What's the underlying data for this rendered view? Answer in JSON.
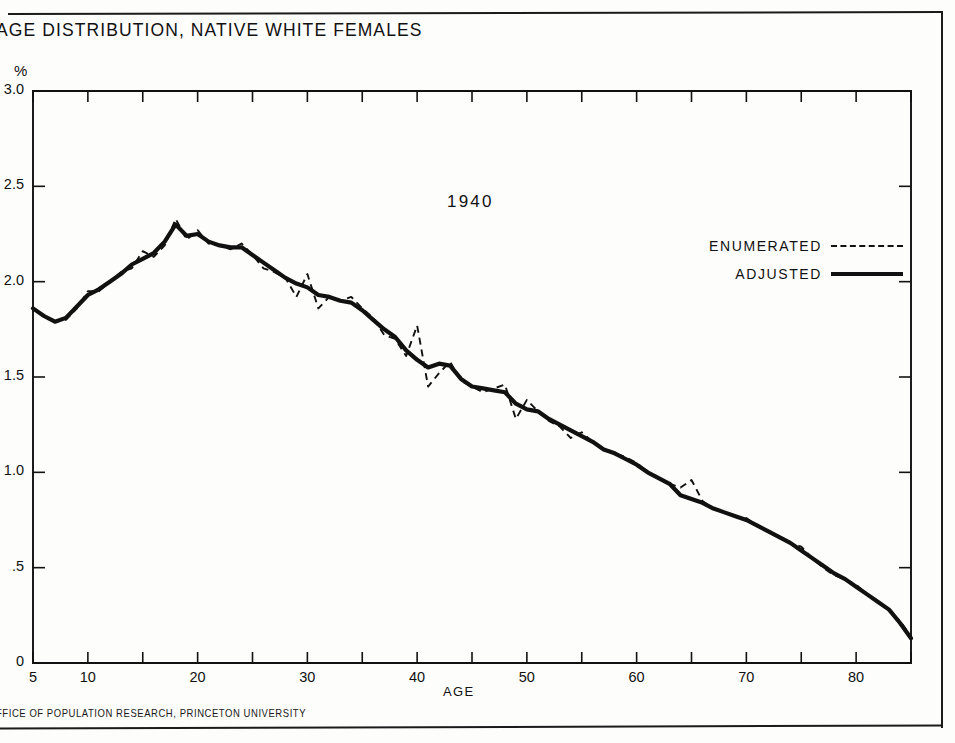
{
  "document": {
    "title": "AGE DISTRIBUTION, NATIVE WHITE FEMALES",
    "footer_credit": "FFICE OF POPULATION RESEARCH, PRINCETON UNIVERSITY"
  },
  "chart_data": {
    "type": "line",
    "title": "AGE DISTRIBUTION, NATIVE WHITE FEMALES",
    "annotation": "1940",
    "xlabel": "AGE",
    "ylabel": "%",
    "y_unit_label": "%",
    "xlim": [
      5,
      85
    ],
    "ylim": [
      0,
      3.0
    ],
    "grid": false,
    "legend_position": "upper right inside",
    "x_ticks": [
      5,
      10,
      15,
      20,
      25,
      30,
      35,
      40,
      45,
      50,
      55,
      60,
      65,
      70,
      75,
      80,
      85
    ],
    "x_tick_labels": [
      "5",
      "10",
      "",
      "20",
      "",
      "30",
      "",
      "40",
      "",
      "50",
      "",
      "60",
      "",
      "70",
      "",
      "80",
      ""
    ],
    "y_ticks": [
      0,
      0.5,
      1.0,
      1.5,
      2.0,
      2.5,
      3.0
    ],
    "y_tick_labels": [
      "0",
      ".5",
      "1.0",
      "1.5",
      "2.0",
      "2.5",
      "3.0"
    ],
    "x": [
      5,
      6,
      7,
      8,
      9,
      10,
      11,
      12,
      13,
      14,
      15,
      16,
      17,
      18,
      19,
      20,
      21,
      22,
      23,
      24,
      25,
      26,
      27,
      28,
      29,
      30,
      31,
      32,
      33,
      34,
      35,
      36,
      37,
      38,
      39,
      40,
      41,
      42,
      43,
      44,
      45,
      46,
      47,
      48,
      49,
      50,
      51,
      52,
      53,
      54,
      55,
      56,
      57,
      58,
      59,
      60,
      61,
      62,
      63,
      64,
      65,
      66,
      67,
      68,
      69,
      70,
      71,
      72,
      73,
      74,
      75,
      76,
      77,
      78,
      79,
      80,
      81,
      82,
      83,
      84,
      85
    ],
    "series": [
      {
        "name": "ENUMERATED",
        "style": "dashed",
        "color": "#111111",
        "values": [
          1.86,
          1.82,
          1.79,
          1.8,
          1.86,
          1.95,
          1.95,
          2.0,
          2.05,
          2.07,
          2.16,
          2.13,
          2.19,
          2.33,
          2.22,
          2.27,
          2.2,
          2.19,
          2.17,
          2.2,
          2.14,
          2.07,
          2.05,
          2.02,
          1.92,
          2.04,
          1.86,
          1.92,
          1.9,
          1.92,
          1.86,
          1.81,
          1.72,
          1.7,
          1.61,
          1.77,
          1.45,
          1.52,
          1.58,
          1.48,
          1.45,
          1.42,
          1.44,
          1.46,
          1.28,
          1.38,
          1.32,
          1.27,
          1.24,
          1.18,
          1.21,
          1.16,
          1.12,
          1.1,
          1.08,
          1.05,
          1.0,
          0.97,
          0.94,
          0.92,
          0.96,
          0.85,
          0.81,
          0.79,
          0.77,
          0.76,
          0.72,
          0.69,
          0.66,
          0.63,
          0.61,
          0.55,
          0.5,
          0.46,
          0.44,
          0.41,
          0.36,
          0.32,
          0.28,
          0.22,
          0.14
        ]
      },
      {
        "name": "ADJUSTED",
        "style": "solid",
        "color": "#111111",
        "values": [
          1.86,
          1.82,
          1.79,
          1.81,
          1.87,
          1.93,
          1.96,
          2.0,
          2.04,
          2.09,
          2.12,
          2.15,
          2.21,
          2.3,
          2.24,
          2.25,
          2.21,
          2.19,
          2.18,
          2.18,
          2.14,
          2.1,
          2.06,
          2.02,
          1.99,
          1.97,
          1.93,
          1.92,
          1.9,
          1.89,
          1.85,
          1.8,
          1.75,
          1.71,
          1.64,
          1.59,
          1.55,
          1.57,
          1.56,
          1.49,
          1.45,
          1.44,
          1.43,
          1.42,
          1.36,
          1.33,
          1.32,
          1.28,
          1.25,
          1.22,
          1.19,
          1.16,
          1.12,
          1.1,
          1.07,
          1.04,
          1.0,
          0.97,
          0.94,
          0.88,
          0.86,
          0.84,
          0.81,
          0.79,
          0.77,
          0.75,
          0.72,
          0.69,
          0.66,
          0.63,
          0.59,
          0.55,
          0.51,
          0.47,
          0.44,
          0.4,
          0.36,
          0.32,
          0.28,
          0.21,
          0.13
        ]
      }
    ]
  },
  "legend": {
    "items": [
      {
        "label": "ENUMERATED",
        "style": "dashed"
      },
      {
        "label": "ADJUSTED",
        "style": "solid"
      }
    ]
  }
}
